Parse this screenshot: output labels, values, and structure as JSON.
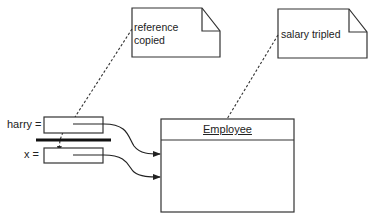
{
  "diagram": {
    "type": "object-reference-diagram",
    "variables": [
      {
        "id": "harry",
        "label": "harry ="
      },
      {
        "id": "x",
        "label": "x ="
      }
    ],
    "object": {
      "class_name": "Employee"
    },
    "notes": [
      {
        "id": "note-reference-copied",
        "line1": "reference",
        "line2": "copied"
      },
      {
        "id": "note-salary-tripled",
        "line1": "salary tripled"
      }
    ],
    "colors": {
      "stroke": "#333333",
      "text": "#222222",
      "background": "#ffffff"
    }
  }
}
